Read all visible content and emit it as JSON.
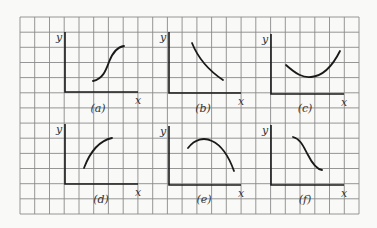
{
  "figure": {
    "grid": {
      "left": 20,
      "top": 17,
      "right": 359,
      "bottom": 214,
      "cols": 23,
      "rows": 13,
      "color": "#8a8a8a"
    },
    "ink": "#1a1a1a",
    "panels": [
      {
        "id": "a",
        "label": "(a)",
        "xlabel": "x",
        "ylabel": "y",
        "axis": {
          "ox": 65,
          "oy": 92,
          "top": 32,
          "right": 138
        },
        "label_pos": [
          98,
          112
        ],
        "shape": "S-curve increasing",
        "curve": "M93,81 C103,79 106,70 109,62 C112,54 116,47 124,46"
      },
      {
        "id": "b",
        "label": "(b)",
        "xlabel": "x",
        "ylabel": "y",
        "axis": {
          "ox": 169,
          "oy": 93,
          "top": 32,
          "right": 241
        },
        "label_pos": [
          203,
          112
        ],
        "shape": "decreasing concave-up",
        "curve": "M192,43 C198,58 208,70 223,80"
      },
      {
        "id": "c",
        "label": "(c)",
        "xlabel": "x",
        "ylabel": "y",
        "axis": {
          "ox": 271,
          "oy": 94,
          "top": 34,
          "right": 344
        },
        "label_pos": [
          305,
          112
        ],
        "shape": "U-shaped minimum",
        "curve": "M286,65 C296,74 303,78 311,77 C324,76 333,65 340,51"
      },
      {
        "id": "d",
        "label": "(d)",
        "xlabel": "x",
        "ylabel": "y",
        "axis": {
          "ox": 65,
          "oy": 184,
          "top": 124,
          "right": 138
        },
        "label_pos": [
          101,
          203
        ],
        "shape": "increasing concave-down",
        "curve": "M84,168 C90,152 98,141 112,138"
      },
      {
        "id": "e",
        "label": "(e)",
        "xlabel": "x",
        "ylabel": "y",
        "axis": {
          "ox": 169,
          "oy": 185,
          "top": 126,
          "right": 241
        },
        "label_pos": [
          204,
          203
        ],
        "shape": "inverted-U maximum",
        "curve": "M188,148 C195,139 204,137 212,141 C223,146 229,157 234,171"
      },
      {
        "id": "f",
        "label": "(f)",
        "xlabel": "x",
        "ylabel": "y",
        "axis": {
          "ox": 271,
          "oy": 185,
          "top": 125,
          "right": 344
        },
        "label_pos": [
          305,
          203
        ],
        "shape": "S-curve decreasing",
        "curve": "M293,137 C301,139 304,148 308,155 C312,163 316,169 322,170"
      }
    ]
  }
}
